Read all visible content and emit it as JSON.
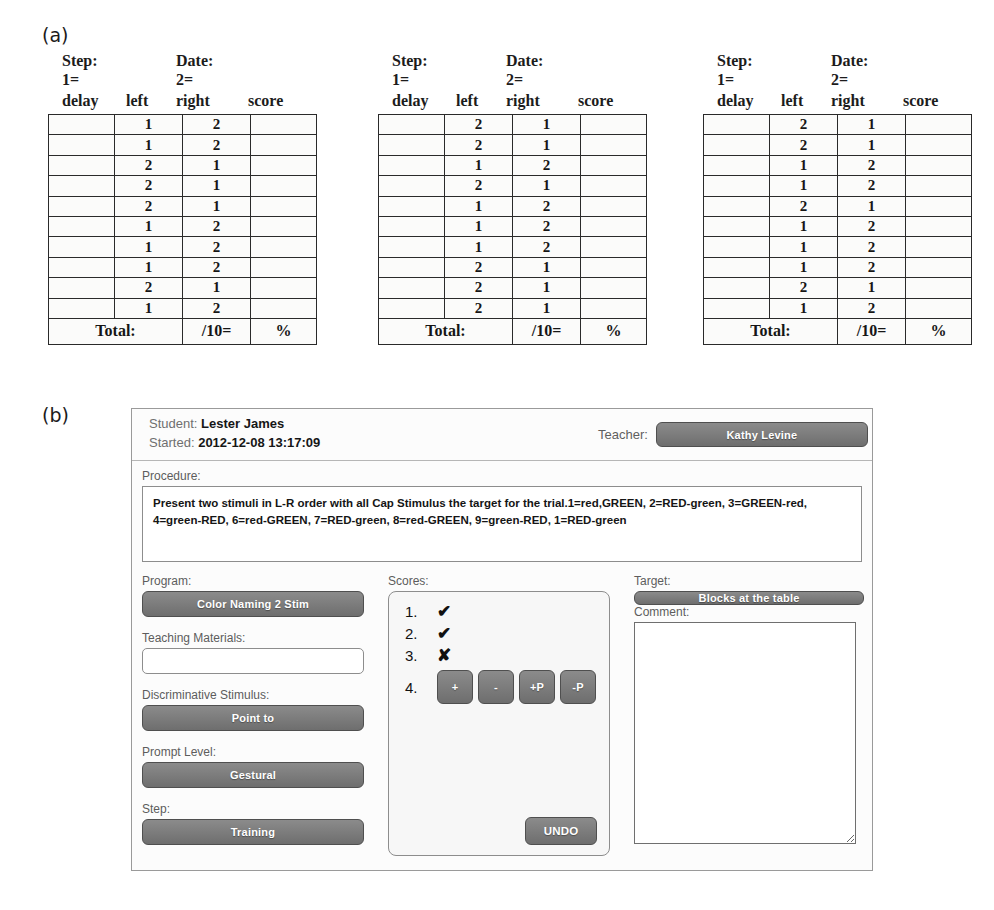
{
  "figure": {
    "panel_a_label": "(a)",
    "panel_b_label": "(b)"
  },
  "datasheets": {
    "headers": {
      "step": "Step:",
      "step_value": "1=",
      "date": "Date:",
      "date_value": "2=",
      "col_delay": "delay",
      "col_left": "left",
      "col_right": "right",
      "col_score": "score",
      "total_label": "Total:",
      "total_denominator": "/10=",
      "total_percent": "%"
    },
    "sheets": [
      {
        "name": "datasheet-1",
        "rows": [
          {
            "left": "1",
            "right": "2",
            "shaded": "right"
          },
          {
            "left": "1",
            "right": "2",
            "shaded": "left"
          },
          {
            "left": "2",
            "right": "1",
            "shaded": "left"
          },
          {
            "left": "2",
            "right": "1",
            "shaded": "right"
          },
          {
            "left": "2",
            "right": "1",
            "shaded": "left"
          },
          {
            "left": "1",
            "right": "2",
            "shaded": "right"
          },
          {
            "left": "1",
            "right": "2",
            "shaded": "left"
          },
          {
            "left": "1",
            "right": "2",
            "shaded": "right"
          },
          {
            "left": "2",
            "right": "1",
            "shaded": "right"
          },
          {
            "left": "1",
            "right": "2",
            "shaded": "left"
          }
        ]
      },
      {
        "name": "datasheet-2",
        "rows": [
          {
            "left": "2",
            "right": "1",
            "shaded": "right"
          },
          {
            "left": "2",
            "right": "1",
            "shaded": "left"
          },
          {
            "left": "1",
            "right": "2",
            "shaded": "left"
          },
          {
            "left": "2",
            "right": "1",
            "shaded": "right"
          },
          {
            "left": "1",
            "right": "2",
            "shaded": "right"
          },
          {
            "left": "1",
            "right": "2",
            "shaded": "left"
          },
          {
            "left": "1",
            "right": "2",
            "shaded": "right"
          },
          {
            "left": "2",
            "right": "1",
            "shaded": "left"
          },
          {
            "left": "2",
            "right": "1",
            "shaded": "right"
          },
          {
            "left": "2",
            "right": "1",
            "shaded": "left"
          }
        ]
      },
      {
        "name": "datasheet-3",
        "rows": [
          {
            "left": "2",
            "right": "1",
            "shaded": "left"
          },
          {
            "left": "2",
            "right": "1",
            "shaded": "right"
          },
          {
            "left": "1",
            "right": "2",
            "shaded": "right"
          },
          {
            "left": "1",
            "right": "2",
            "shaded": "left"
          },
          {
            "left": "2",
            "right": "1",
            "shaded": "left"
          },
          {
            "left": "1",
            "right": "2",
            "shaded": "right"
          },
          {
            "left": "1",
            "right": "2",
            "shaded": "left"
          },
          {
            "left": "1",
            "right": "2",
            "shaded": "right"
          },
          {
            "left": "2",
            "right": "1",
            "shaded": "right"
          },
          {
            "left": "1",
            "right": "2",
            "shaded": "left"
          }
        ]
      }
    ]
  },
  "app": {
    "header": {
      "student_label": "Student:",
      "student_name": "Lester James",
      "started_label": "Started:",
      "started_value": "2012-12-08 13:17:09",
      "teacher_label": "Teacher:",
      "teacher_name": "Kathy Levine"
    },
    "procedure": {
      "label": "Procedure:",
      "text": "Present two stimuli in L-R order with all Cap Stimulus the target for the trial.1=red,GREEN, 2=RED-green, 3=GREEN-red, 4=green-RED, 6=red-GREEN, 7=RED-green, 8=red-GREEN, 9=green-RED, 1=RED-green"
    },
    "left_column": {
      "program_label": "Program:",
      "program_value": "Color Naming 2 Stim",
      "teaching_materials_label": "Teaching Materials:",
      "teaching_materials_value": "",
      "teaching_materials_placeholder": "",
      "discriminative_stimulus_label": "Discriminative Stimulus:",
      "discriminative_stimulus_value": "Point to",
      "prompt_level_label": "Prompt Level:",
      "prompt_level_value": "Gestural",
      "step_label": "Step:",
      "step_value": "Training"
    },
    "scores": {
      "label": "Scores:",
      "entries": [
        {
          "number": "1.",
          "mark": "✔"
        },
        {
          "number": "2.",
          "mark": "✔"
        },
        {
          "number": "3.",
          "mark": "✘"
        }
      ],
      "active_number": "4.",
      "buttons": [
        "+",
        "-",
        "+P",
        "-P"
      ],
      "undo_label": "UNDO"
    },
    "right_column": {
      "target_label": "Target:",
      "target_value": "Blocks at the table",
      "comment_label": "Comment:",
      "comment_value": "",
      "comment_placeholder": ""
    }
  },
  "colors": {
    "button_grey": "#7b7b7b",
    "shaded_cell": "#a9a9a9",
    "panel_border": "#9a9a9a"
  }
}
